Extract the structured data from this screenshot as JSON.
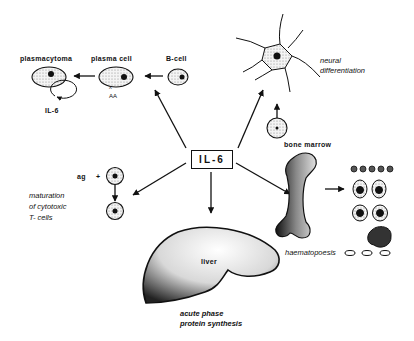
{
  "center": {
    "label": "IL-6"
  },
  "b_cell_branch": {
    "plasmacytoma": "plasmacytoma",
    "plasma_cell": "plasma cell",
    "b_cell": "B-cell",
    "autocrine_label": "IL-6"
  },
  "neural_branch": {
    "label_line1": "neural",
    "label_line2": "differentiation"
  },
  "t_cell_branch": {
    "ag_label": "ag",
    "plus": "+",
    "label_line1": "maturation",
    "label_line2": "of cytotoxic",
    "label_line3": "T- cells"
  },
  "liver_branch": {
    "organ_label": "liver",
    "label_line1": "acute phase",
    "label_line2": "protein synthesis"
  },
  "bone_marrow_branch": {
    "organ_label": "bone marrow",
    "label": "haematopoesis"
  },
  "colors": {
    "ink": "#111111",
    "stipple": "#9a9a9a",
    "background": "#ffffff"
  }
}
